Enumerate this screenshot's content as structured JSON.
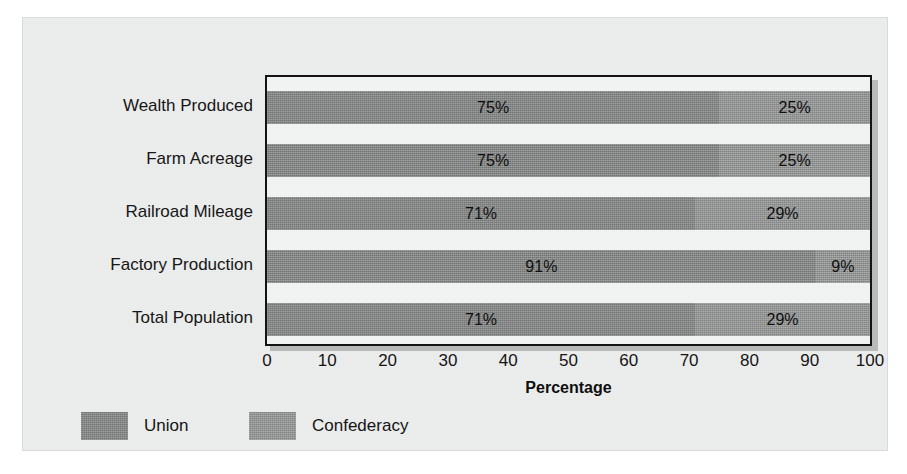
{
  "chart_data": {
    "type": "bar",
    "orientation": "horizontal",
    "stacked": true,
    "title": "",
    "xlabel": "Percentage",
    "ylabel": "",
    "xlim": [
      0,
      100
    ],
    "xticks": [
      0,
      10,
      20,
      30,
      40,
      50,
      60,
      70,
      80,
      90,
      100
    ],
    "xtick_labels": [
      "0",
      "10",
      "20",
      "30",
      "40",
      "50",
      "60",
      "70",
      "80",
      "90",
      "100"
    ],
    "grid": false,
    "legend_position": "bottom-left",
    "categories": [
      "Wealth Produced",
      "Farm Acreage",
      "Railroad Mileage",
      "Factory Production",
      "Total Population"
    ],
    "series": [
      {
        "name": "Union",
        "color": "#8a8c8c",
        "values": [
          75,
          75,
          71,
          91,
          71
        ],
        "value_labels": [
          "75%",
          "75%",
          "71%",
          "91%",
          "71%"
        ]
      },
      {
        "name": "Confederacy",
        "color": "#949696",
        "values": [
          25,
          25,
          29,
          9,
          29
        ],
        "value_labels": [
          "25%",
          "25%",
          "29%",
          "9%",
          "29%"
        ]
      }
    ]
  },
  "legend": {
    "entries": [
      {
        "label": "Union",
        "color": "#8a8c8c"
      },
      {
        "label": "Confederacy",
        "color": "#949696"
      }
    ]
  },
  "axis": {
    "x_title": "Percentage"
  },
  "colors": {
    "card_background": "#eceded",
    "plot_background": "#f2f3f3",
    "plot_border": "#121212",
    "union": "#8a8c8c",
    "confederacy": "#949696",
    "text": "#131313"
  }
}
